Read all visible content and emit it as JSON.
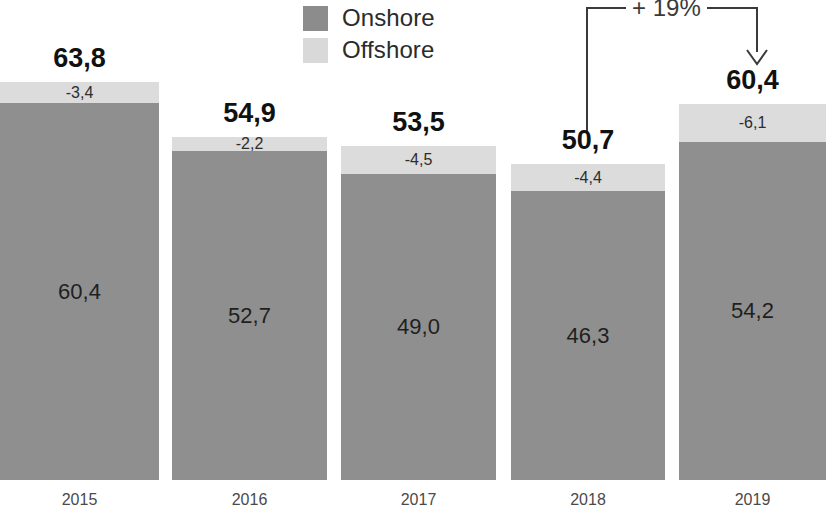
{
  "legend": {
    "items": [
      {
        "label": "Onshore",
        "color": "#8c8c8c",
        "key": "onshore"
      },
      {
        "label": "Offshore",
        "color": "#d9d9d9",
        "key": "offshore"
      }
    ]
  },
  "annotation": {
    "label": "+ 19%",
    "from_category": "2018",
    "to_category": "2019"
  },
  "chart_data": {
    "type": "bar",
    "stacked": true,
    "title": "",
    "subtitle": "",
    "xlabel": "",
    "ylabel": "",
    "grid": false,
    "legend_position": "top-center",
    "ylim": [
      0,
      63.8
    ],
    "categories": [
      "2015",
      "2016",
      "2017",
      "2018",
      "2019"
    ],
    "totals": [
      "63,8",
      "54,9",
      "53,5",
      "50,7",
      "60,4"
    ],
    "totals_numeric": [
      63.8,
      54.9,
      53.5,
      50.7,
      60.4
    ],
    "series": [
      {
        "name": "Onshore",
        "color": "#8f8f8f",
        "values": [
          60.4,
          52.7,
          49.0,
          46.3,
          54.2
        ],
        "labels": [
          "60,4",
          "52,7",
          "49,0",
          "46,3",
          "54,2"
        ]
      },
      {
        "name": "Offshore",
        "color": "#dcdcdc",
        "values": [
          3.4,
          2.2,
          4.5,
          4.4,
          6.1
        ],
        "labels": [
          "-3,4",
          "-2,2",
          "-4,5",
          "-4,4",
          "-6,1"
        ]
      }
    ],
    "annotations": [
      {
        "text": "+ 19%",
        "from": "2018",
        "to": "2019"
      }
    ]
  }
}
